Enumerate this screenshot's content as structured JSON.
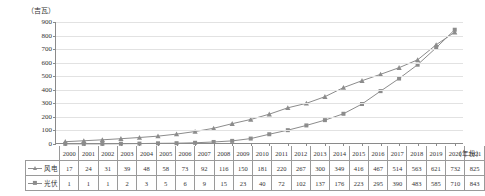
{
  "chart_data": {
    "type": "line",
    "title": "",
    "subtitle": "",
    "xlabel": "（年份）",
    "ylabel": "（吉瓦）",
    "ylim": [
      0,
      900
    ],
    "ytick_step": 100,
    "yticks": [
      0,
      100,
      200,
      300,
      400,
      500,
      600,
      700,
      800,
      900
    ],
    "grid": true,
    "legend_position": "table-below",
    "categories": [
      "2000",
      "2001",
      "2002",
      "2003",
      "2004",
      "2005",
      "2006",
      "2007",
      "2008",
      "2009",
      "2010",
      "2011",
      "2012",
      "2013",
      "2014",
      "2015",
      "2016",
      "2017",
      "2018",
      "2019",
      "2020",
      "2021"
    ],
    "series": [
      {
        "name": "风电",
        "marker": "triangle",
        "color": "#8c8c8c",
        "values": [
          17,
          24,
          31,
          39,
          48,
          58,
          73,
          92,
          116,
          150,
          181,
          220,
          267,
          300,
          349,
          416,
          467,
          514,
          563,
          621,
          732,
          825
        ]
      },
      {
        "name": "光伏",
        "marker": "square",
        "color": "#8c8c8c",
        "values": [
          1,
          1,
          1,
          2,
          3,
          5,
          6,
          9,
          15,
          23,
          40,
          72,
          102,
          137,
          176,
          223,
          295,
          390,
          483,
          585,
          710,
          843
        ]
      }
    ]
  },
  "table": {
    "corner_label": "",
    "year_header": [
      "2000",
      "2001",
      "2002",
      "2003",
      "2004",
      "2005",
      "2006",
      "2007",
      "2008",
      "2009",
      "2010",
      "2011",
      "2012",
      "2013",
      "2014",
      "2015",
      "2016",
      "2017",
      "2018",
      "2019",
      "2020",
      "2021"
    ],
    "rows": [
      {
        "label": "风电",
        "marker": "triangle",
        "values": [
          "17",
          "24",
          "31",
          "39",
          "48",
          "58",
          "73",
          "92",
          "116",
          "150",
          "181",
          "220",
          "267",
          "300",
          "349",
          "416",
          "467",
          "514",
          "563",
          "621",
          "732",
          "825"
        ]
      },
      {
        "label": "光伏",
        "marker": "square",
        "values": [
          "1",
          "1",
          "1",
          "2",
          "3",
          "5",
          "6",
          "9",
          "15",
          "23",
          "40",
          "72",
          "102",
          "137",
          "176",
          "223",
          "295",
          "390",
          "483",
          "585",
          "710",
          "843"
        ]
      }
    ]
  },
  "axis": {
    "y_unit": "（吉瓦）",
    "x_unit": "（年份）"
  },
  "colors": {
    "series_line": "#8c8c8c",
    "gridline": "#e2e2e2",
    "axis": "#8a8a8a",
    "text": "#333333"
  }
}
